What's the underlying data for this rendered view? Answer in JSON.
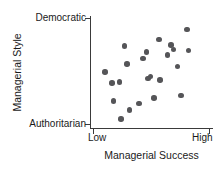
{
  "chart_data": {
    "type": "scatter",
    "title": "",
    "xlabel": "Managerial Success",
    "ylabel": "Managerial Style",
    "x_tick_labels": [
      "Low",
      "High"
    ],
    "y_tick_labels": [
      "Authoritarian",
      "Democratic"
    ],
    "xlim": [
      0,
      1
    ],
    "ylim": [
      0,
      1
    ],
    "grid": false,
    "legend": null,
    "marker": {
      "shape": "circle",
      "color": "#555558",
      "size_px": 5.5
    },
    "axis_color": "#3a3a3a",
    "background_color": "#ffffff",
    "n_points": 22,
    "points": [
      {
        "x": 0.12,
        "y": 0.5
      },
      {
        "x": 0.18,
        "y": 0.4
      },
      {
        "x": 0.19,
        "y": 0.24
      },
      {
        "x": 0.24,
        "y": 0.41
      },
      {
        "x": 0.25,
        "y": 0.08
      },
      {
        "x": 0.28,
        "y": 0.73
      },
      {
        "x": 0.3,
        "y": 0.57
      },
      {
        "x": 0.32,
        "y": 0.16
      },
      {
        "x": 0.4,
        "y": 0.22
      },
      {
        "x": 0.43,
        "y": 0.62
      },
      {
        "x": 0.46,
        "y": 0.68
      },
      {
        "x": 0.47,
        "y": 0.44
      },
      {
        "x": 0.49,
        "y": 0.46
      },
      {
        "x": 0.52,
        "y": 0.27
      },
      {
        "x": 0.56,
        "y": 0.79
      },
      {
        "x": 0.57,
        "y": 0.43
      },
      {
        "x": 0.63,
        "y": 0.65
      },
      {
        "x": 0.66,
        "y": 0.74
      },
      {
        "x": 0.68,
        "y": 0.7
      },
      {
        "x": 0.71,
        "y": 0.55
      },
      {
        "x": 0.74,
        "y": 0.29
      },
      {
        "x": 0.79,
        "y": 0.88
      },
      {
        "x": 0.8,
        "y": 0.69
      }
    ]
  }
}
